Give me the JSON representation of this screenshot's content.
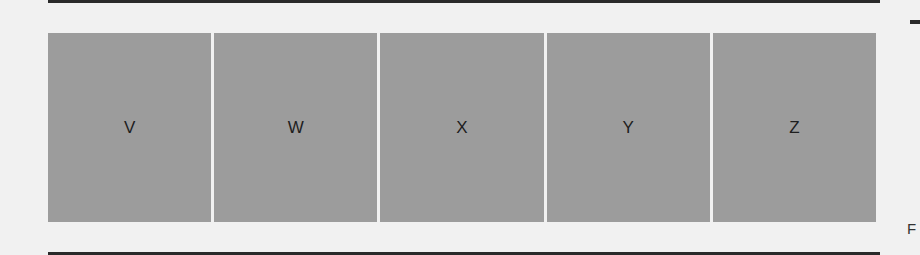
{
  "diagram": {
    "boxes": [
      {
        "label": "V"
      },
      {
        "label": "W"
      },
      {
        "label": "X"
      },
      {
        "label": "Y"
      },
      {
        "label": "Z"
      }
    ],
    "box_color": "#9c9c9c",
    "rule_color": "#2a2a2a"
  },
  "edge_fragments": {
    "right_text_1": "F",
    "right_text_2": "F"
  }
}
